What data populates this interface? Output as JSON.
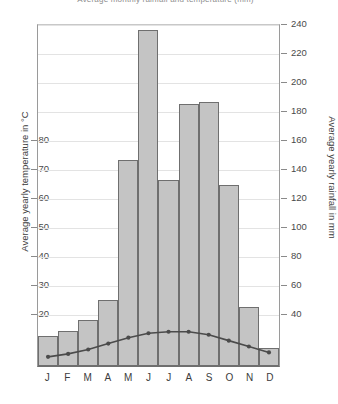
{
  "chart": {
    "title": "Average monthly rainfall and temperature (mm)",
    "left_axis_title": "Average yearly temperature in °C",
    "right_axis_title": "Average yearly rainfall in mm"
  },
  "chart_data": {
    "type": "bar",
    "title": "Average monthly rainfall and temperature (mm)",
    "categories": [
      "J",
      "F",
      "M",
      "A",
      "M",
      "J",
      "J",
      "A",
      "S",
      "O",
      "N",
      "D"
    ],
    "series": [
      {
        "name": "Average yearly rainfall in mm",
        "type": "bar",
        "axis": "right",
        "values": [
          50,
          53,
          60,
          72,
          157,
          236,
          145,
          191,
          192,
          142,
          68,
          43
        ]
      },
      {
        "name": "Average yearly temperature in °C",
        "type": "line",
        "axis": "left",
        "values": [
          19.5,
          20.5,
          22,
          24,
          26,
          27.5,
          28,
          28,
          27,
          25,
          23,
          21
        ]
      }
    ],
    "xlabel": "",
    "ylabel": "Average yearly temperature in °C",
    "y2label": "Average yearly rainfall in mm",
    "ylim": [
      16.4,
      132
    ],
    "y2lim": [
      32,
      240
    ],
    "yticks": [
      20,
      30,
      40,
      50,
      60,
      70,
      80
    ],
    "y2ticks": [
      40,
      60,
      80,
      100,
      120,
      140,
      160,
      180,
      200,
      220,
      240
    ],
    "grid": true,
    "legend": "none",
    "bar_color": "#c4c4c4",
    "bar_edge_color": "#6f6f6f",
    "line_color": "#4b4b4b"
  },
  "axis_left": {
    "ticks": [
      {
        "label": "80",
        "y": 140
      },
      {
        "label": "70",
        "y": 169
      },
      {
        "label": "60",
        "y": 198
      },
      {
        "label": "50",
        "y": 227
      },
      {
        "label": "40",
        "y": 256
      },
      {
        "label": "30",
        "y": 285
      },
      {
        "label": "20",
        "y": 314
      }
    ]
  },
  "axis_right": {
    "ticks": [
      {
        "label": "240",
        "y": 24
      },
      {
        "label": "220",
        "y": 53
      },
      {
        "label": "200",
        "y": 82
      },
      {
        "label": "180",
        "y": 111
      },
      {
        "label": "160",
        "y": 140
      },
      {
        "label": "140",
        "y": 169
      },
      {
        "label": "120",
        "y": 198
      },
      {
        "label": "100",
        "y": 227
      },
      {
        "label": "80",
        "y": 256
      },
      {
        "label": "60",
        "y": 285
      },
      {
        "label": "40",
        "y": 314
      }
    ]
  }
}
